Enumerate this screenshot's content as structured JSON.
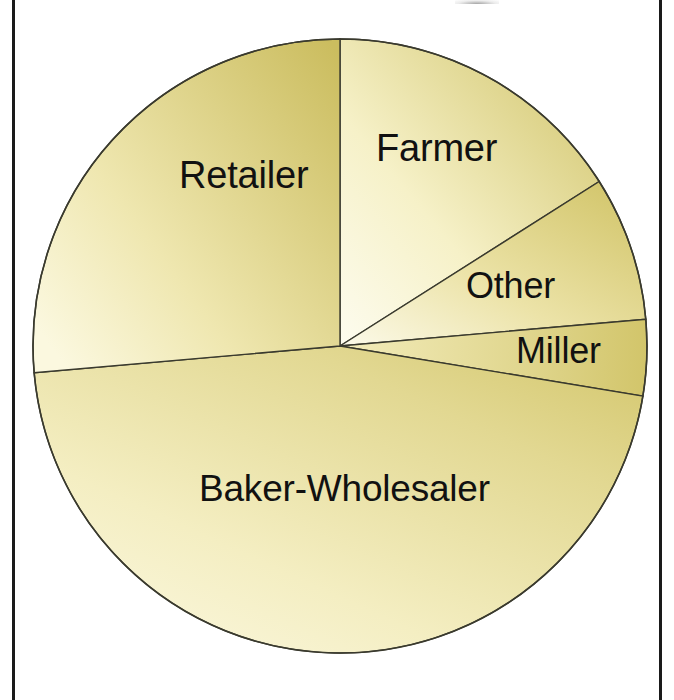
{
  "figure": {
    "background_color": "#ffffff",
    "frame_color": "#1a1a1a",
    "outline_color": "#3a3a2e"
  },
  "chart_data": {
    "type": "pie",
    "title": "",
    "subtitle": "",
    "xlabel": "",
    "ylabel": "",
    "legend_position": "none",
    "grid": false,
    "labels_inside_slices": true,
    "start_angle_deg": 0,
    "direction": "clockwise",
    "categories": [
      "Farmer",
      "Other",
      "Miller",
      "Baker-Wholesaler",
      "Retailer"
    ],
    "values": [
      16.0,
      7.6,
      4.0,
      46.0,
      26.4
    ],
    "units": "percent",
    "slices": [
      {
        "label": "Farmer",
        "value": 16.0,
        "start_angle_deg": 0.0,
        "end_angle_deg": 57.6,
        "fill_light": "#fdfbe8",
        "fill_dark": "#cfc266"
      },
      {
        "label": "Other",
        "value": 7.6,
        "start_angle_deg": 57.6,
        "end_angle_deg": 85.0,
        "fill_light": "#fdfbe8",
        "fill_dark": "#d2c56a"
      },
      {
        "label": "Miller",
        "value": 4.0,
        "start_angle_deg": 85.0,
        "end_angle_deg": 99.4,
        "fill_light": "#f6f0c4",
        "fill_dark": "#d2c56a"
      },
      {
        "label": "Baker-Wholesaler",
        "value": 46.0,
        "start_angle_deg": 99.4,
        "end_angle_deg": 265.0,
        "fill_light": "#f7f2cc",
        "fill_dark": "#d3c66b"
      },
      {
        "label": "Retailer",
        "value": 26.4,
        "start_angle_deg": 265.0,
        "end_angle_deg": 360.0,
        "fill_light": "#f5efc0",
        "fill_dark": "#cbbd5f"
      }
    ],
    "geometry": {
      "center_x": 340,
      "center_y": 346,
      "radius": 307
    }
  },
  "labels": {
    "farmer": "Farmer",
    "other": "Other",
    "miller": "Miller",
    "baker_wholesaler": "Baker-Wholesaler",
    "retailer": "Retailer"
  }
}
